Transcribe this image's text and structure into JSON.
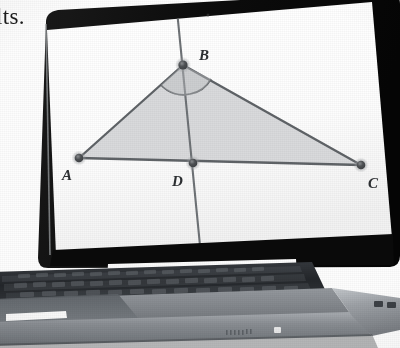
{
  "page": {
    "margin_text": "lts.",
    "background": "#ffffff",
    "width": 400,
    "height": 348
  },
  "photo": {
    "subject": "laptop-computer",
    "description": "photograph of an open laptop displaying a dynamic geometry construction",
    "colors": {
      "bezel": "#111111",
      "screen": "#fdfdfd",
      "body_top": "#8d9196",
      "body_light": "#b9bdc2",
      "body_dark": "#5a5f64",
      "key_dark": "#2a2d31",
      "highlight": "#ffffff"
    }
  },
  "laptop": {
    "screen": {
      "name": "display",
      "content_type": "geometry-figure"
    },
    "base": {
      "keyboard": "keyboard-keys",
      "trackpad": "trackpad",
      "hinge_strip": "hinge-strip",
      "vent": "front-vent-grille",
      "indicator": "status-light",
      "ports": "side-ports"
    }
  },
  "figure": {
    "type": "triangle-with-cevian",
    "fill": "#d6d7d9",
    "stroke": "#6e7276",
    "point_color": "#4a4d50",
    "points": [
      {
        "id": "A",
        "label": "A",
        "x": 79,
        "y": 158,
        "label_x": 63,
        "label_y": 176
      },
      {
        "id": "B",
        "label": "B",
        "x": 183,
        "y": 65,
        "label_x": 200,
        "label_y": 56
      },
      {
        "id": "C",
        "label": "C",
        "x": 361,
        "y": 165,
        "label_x": 371,
        "label_y": 185
      },
      {
        "id": "D",
        "label": "D",
        "x": 193,
        "y": 163,
        "label_x": 174,
        "label_y": 182
      }
    ],
    "segments": [
      {
        "name": "side-AB",
        "from": "A",
        "to": "B"
      },
      {
        "name": "side-BC",
        "from": "B",
        "to": "C"
      },
      {
        "name": "side-AC",
        "from": "A",
        "to": "C"
      },
      {
        "name": "cevian-BD",
        "from": "B",
        "to": "D"
      }
    ],
    "extended_line": {
      "name": "line-through-B-and-D",
      "x1": 178,
      "y1": 8,
      "x2": 200,
      "y2": 258
    },
    "angle_marks": [
      {
        "name": "angle-ABD-arc",
        "at": "B"
      },
      {
        "name": "angle-DBC-arc",
        "at": "B"
      }
    ],
    "labels": [
      "A",
      "B",
      "C",
      "D"
    ]
  }
}
